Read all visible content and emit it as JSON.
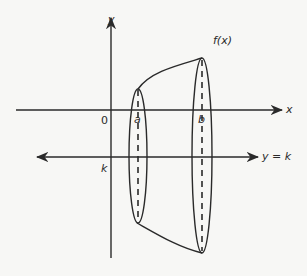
{
  "diagram": {
    "labels": {
      "y_axis": "y",
      "x_axis": "x",
      "origin": "0",
      "function": "f(x)",
      "a": "a",
      "b": "b",
      "k": "k",
      "axis_of_rotation": "y = k"
    },
    "colors": {
      "stroke": "#2a2a2a",
      "background": "#f7f7f5"
    }
  }
}
